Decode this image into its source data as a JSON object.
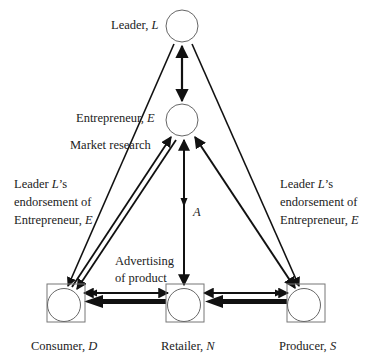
{
  "nodes": {
    "leader": {
      "name": "Leader, ",
      "symbol": "L"
    },
    "entrepreneur": {
      "name": "Entrepreneur, ",
      "symbol": "E"
    },
    "consumer": {
      "name": "Consumer, ",
      "symbol": "D"
    },
    "retailer": {
      "name": "Retailer, ",
      "symbol": "N"
    },
    "producer": {
      "name": "Producer, ",
      "symbol": "S"
    }
  },
  "edge_labels": {
    "market_research": "Market research",
    "advertising_line1": "Advertising",
    "advertising_line2": "of product",
    "a_symbol": "A",
    "endorsement_left": {
      "line1_pre": "Leader ",
      "line1_sym": "L",
      "line1_post": "’s",
      "line2": "endorsement of",
      "line3_pre": "Entrepreneur, ",
      "line3_sym": "E"
    },
    "endorsement_right": {
      "line1_pre": "Leader ",
      "line1_sym": "L",
      "line1_post": "’s",
      "line2": "endorsement of",
      "line3_pre": "Entrepreneur, ",
      "line3_sym": "E"
    }
  },
  "colors": {
    "line": "#111111",
    "node_stroke": "#666666",
    "background": "#ffffff"
  }
}
